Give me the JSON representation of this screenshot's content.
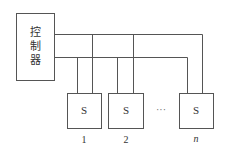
{
  "diagram": {
    "controller": {
      "label_chars": [
        "控",
        "制",
        "器"
      ]
    },
    "switches": [
      {
        "label": "S",
        "index": "1"
      },
      {
        "label": "S",
        "index": "2"
      },
      {
        "label": "S",
        "index": "n"
      }
    ],
    "ellipsis": "···",
    "colors": {
      "line": "#555555",
      "text": "#333333",
      "background": "#ffffff"
    }
  }
}
